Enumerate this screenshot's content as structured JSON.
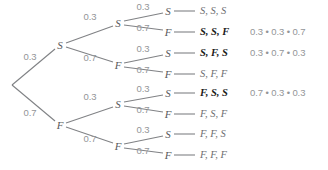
{
  "diagram": {
    "colors": {
      "edge": "#808285",
      "node_text": "#58595b",
      "probability_text": "#939598",
      "outcome_text": "#6d6e71",
      "outcome_highlight": "#1a1a1a",
      "background": "#ffffff"
    },
    "root": {
      "name": "root-node",
      "x": 10,
      "y": 85
    },
    "level1": [
      {
        "name": "node-s",
        "label": "S",
        "prob": "0.3",
        "x": 60,
        "y": 45,
        "prob_x": 30,
        "prob_y": 57
      },
      {
        "name": "node-f",
        "label": "F",
        "prob": "0.7",
        "x": 60,
        "y": 125,
        "prob_x": 30,
        "prob_y": 113
      }
    ],
    "level2": [
      {
        "name": "node-ss",
        "label": "S",
        "prob": "0.3",
        "x": 118,
        "y": 23,
        "prob_x": 90,
        "prob_y": 17
      },
      {
        "name": "node-sf",
        "label": "F",
        "prob": "0.7",
        "x": 118,
        "y": 65,
        "prob_x": 90,
        "prob_y": 58
      },
      {
        "name": "node-fs",
        "label": "S",
        "prob": "0.3",
        "x": 118,
        "y": 104,
        "prob_x": 90,
        "prob_y": 97
      },
      {
        "name": "node-ff",
        "label": "F",
        "prob": "0.7",
        "x": 118,
        "y": 146,
        "prob_x": 90,
        "prob_y": 139
      }
    ],
    "level3": [
      {
        "name": "leaf-node-1",
        "label": "S",
        "prob": "0.3",
        "x": 168,
        "y": 11,
        "prob_x": 143,
        "prob_y": 7
      },
      {
        "name": "leaf-node-2",
        "label": "F",
        "prob": "0.7",
        "x": 168,
        "y": 32,
        "prob_x": 143,
        "prob_y": 28
      },
      {
        "name": "leaf-node-3",
        "label": "S",
        "prob": "0.3",
        "x": 168,
        "y": 53,
        "prob_x": 143,
        "prob_y": 49
      },
      {
        "name": "leaf-node-4",
        "label": "F",
        "prob": "0.7",
        "x": 168,
        "y": 74,
        "prob_x": 143,
        "prob_y": 70
      },
      {
        "name": "leaf-node-5",
        "label": "S",
        "prob": "0.3",
        "x": 168,
        "y": 93,
        "prob_x": 143,
        "prob_y": 89
      },
      {
        "name": "leaf-node-6",
        "label": "F",
        "prob": "0.7",
        "x": 168,
        "y": 114,
        "prob_x": 143,
        "prob_y": 110
      },
      {
        "name": "leaf-node-7",
        "label": "S",
        "prob": "0.3",
        "x": 168,
        "y": 134,
        "prob_x": 143,
        "prob_y": 130
      },
      {
        "name": "leaf-node-8",
        "label": "F",
        "prob": "0.7",
        "x": 168,
        "y": 155,
        "prob_x": 143,
        "prob_y": 151
      }
    ],
    "outcomes": [
      {
        "name": "outcome-sss",
        "text": "S, S, S",
        "highlight": false,
        "x": 200,
        "y": 11,
        "product": "",
        "product_x": 250
      },
      {
        "name": "outcome-ssf",
        "text": "S, S, F",
        "highlight": true,
        "x": 200,
        "y": 32,
        "product": "0.3 • 0.3 • 0.7",
        "product_x": 250
      },
      {
        "name": "outcome-sfs",
        "text": "S, F, S",
        "highlight": true,
        "x": 200,
        "y": 53,
        "product": "0.3 • 0.7 • 0.3",
        "product_x": 250
      },
      {
        "name": "outcome-sff",
        "text": "S, F, F",
        "highlight": false,
        "x": 200,
        "y": 74,
        "product": "",
        "product_x": 250
      },
      {
        "name": "outcome-fss",
        "text": "F, S, S",
        "highlight": true,
        "x": 200,
        "y": 93,
        "product": "0.7 • 0.3 • 0.3",
        "product_x": 250
      },
      {
        "name": "outcome-fsf",
        "text": "F, S, F",
        "highlight": false,
        "x": 200,
        "y": 114,
        "product": "",
        "product_x": 250
      },
      {
        "name": "outcome-ffs",
        "text": "F, F, S",
        "highlight": false,
        "x": 200,
        "y": 134,
        "product": "",
        "product_x": 250
      },
      {
        "name": "outcome-fff",
        "text": "F, F, F",
        "highlight": false,
        "x": 200,
        "y": 155,
        "product": "",
        "product_x": 250
      }
    ]
  }
}
